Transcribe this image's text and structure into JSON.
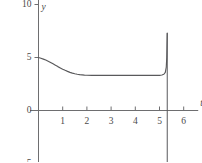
{
  "chart_data": {
    "type": "line",
    "title": "",
    "subtitle": "",
    "xlabel": "t",
    "ylabel": "y",
    "xlim": [
      -0.35,
      6.6
    ],
    "ylim": [
      -6.0,
      11.0
    ],
    "grid": false,
    "legend": null,
    "xticks": [
      1,
      2,
      3,
      4,
      5,
      6
    ],
    "xtick_labels": [
      "1",
      "2",
      "3",
      "4",
      "5",
      "6"
    ],
    "yticks": [
      10,
      5,
      0,
      -5
    ],
    "ytick_labels": [
      "10",
      "5",
      "0",
      "−5"
    ],
    "annotations": [
      {
        "name": "vertical-asymptote",
        "type": "vline",
        "x": 5.32,
        "y_top": 7.3,
        "y_bottom": -6.0
      }
    ],
    "series": [
      {
        "name": "solution-curve",
        "color": "#59595b",
        "x": [
          0.0,
          0.1,
          0.2,
          0.3,
          0.4,
          0.5,
          0.6,
          0.7,
          0.8,
          0.9,
          1.0,
          1.1,
          1.2,
          1.3,
          1.4,
          1.5,
          1.6,
          1.7,
          1.8,
          1.9,
          2.0,
          2.2,
          2.4,
          2.6,
          2.8,
          3.0,
          3.2,
          3.4,
          3.6,
          3.8,
          4.0,
          4.2,
          4.4,
          4.6,
          4.8,
          5.0,
          5.1,
          5.18,
          5.24,
          5.28,
          5.3,
          5.31,
          5.32
        ],
        "y": [
          5.0,
          4.93,
          4.85,
          4.76,
          4.65,
          4.53,
          4.4,
          4.27,
          4.14,
          4.02,
          3.9,
          3.79,
          3.69,
          3.6,
          3.53,
          3.47,
          3.42,
          3.38,
          3.36,
          3.34,
          3.33,
          3.32,
          3.31,
          3.31,
          3.31,
          3.31,
          3.31,
          3.31,
          3.31,
          3.31,
          3.31,
          3.31,
          3.31,
          3.31,
          3.31,
          3.32,
          3.35,
          3.42,
          3.6,
          4.1,
          5.0,
          6.2,
          7.3
        ]
      }
    ]
  },
  "axes": {
    "y_axis_name": "y",
    "x_axis_name": "t",
    "axis_color": "#6e6e70",
    "curve_color": "#59595b"
  }
}
